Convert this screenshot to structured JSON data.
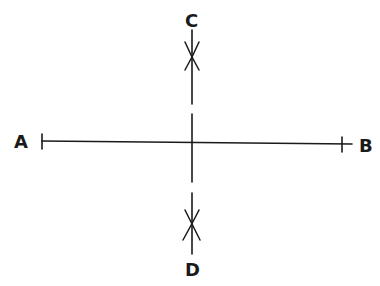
{
  "diagram": {
    "stroke_color": "#1a1a1a",
    "background": "#ffffff",
    "points": [
      {
        "id": "A",
        "label": "A",
        "x": 42,
        "y": 141
      },
      {
        "id": "B",
        "label": "B",
        "x": 342,
        "y": 144
      },
      {
        "id": "C",
        "label": "C",
        "x": 192,
        "y": 57
      },
      {
        "id": "D",
        "label": "D",
        "x": 192,
        "y": 225
      }
    ],
    "segments": [
      {
        "id": "AB",
        "from": "A",
        "to": "B",
        "style": "solid"
      },
      {
        "id": "CD",
        "from": "C",
        "to": "D",
        "style": "broken"
      }
    ],
    "arc_marks": [
      {
        "at": "C",
        "type": "intersecting-arcs"
      },
      {
        "at": "D",
        "type": "intersecting-arcs"
      }
    ],
    "labels": {
      "A": "A",
      "B": "B",
      "C": "C",
      "D": "D"
    }
  }
}
